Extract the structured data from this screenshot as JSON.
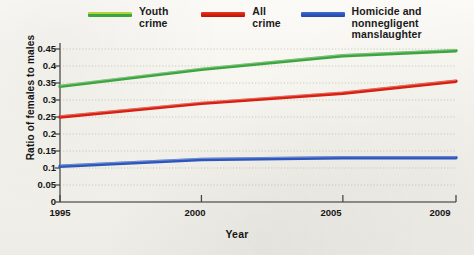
{
  "legend": {
    "items": [
      {
        "label": "Youth crime",
        "color": "#3da53f",
        "swatch": "green"
      },
      {
        "label": "All crime",
        "color": "#d81f10",
        "swatch": "red"
      },
      {
        "label": "Homicide and nonnegligent\nmanslaughter",
        "color": "#2d56bd",
        "swatch": "blue"
      }
    ]
  },
  "axes": {
    "ylabel": "Ratio of females to males",
    "xlabel": "Year",
    "yticks": [
      "0.45",
      "0.4",
      "0.35",
      "0.3",
      "0.25",
      "0.2",
      "0.15",
      "0.1",
      "0.05",
      "0"
    ],
    "xticks": [
      "1995",
      "2000",
      "2005",
      "2009"
    ]
  },
  "chart_data": {
    "type": "line",
    "title": "",
    "xlabel": "Year",
    "ylabel": "Ratio of females to males",
    "x": [
      1995,
      2000,
      2005,
      2009
    ],
    "xlim": [
      1995,
      2009
    ],
    "ylim": [
      0,
      0.45
    ],
    "ytick_values": [
      0,
      0.05,
      0.1,
      0.15,
      0.2,
      0.25,
      0.3,
      0.35,
      0.4,
      0.45
    ],
    "xtick_values": [
      1995,
      2000,
      2005,
      2009
    ],
    "grid": true,
    "legend_position": "top",
    "series": [
      {
        "name": "Youth crime",
        "color": "#3da53f",
        "values": [
          0.34,
          0.39,
          0.43,
          0.445
        ]
      },
      {
        "name": "All crime",
        "color": "#d81f10",
        "values": [
          0.25,
          0.29,
          0.32,
          0.355
        ]
      },
      {
        "name": "Homicide and nonnegligent manslaughter",
        "color": "#2d56bd",
        "values": [
          0.105,
          0.125,
          0.13,
          0.13
        ]
      }
    ]
  }
}
